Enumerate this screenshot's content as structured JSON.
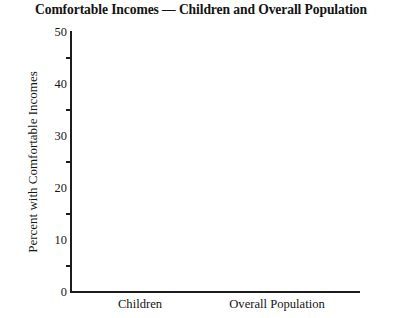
{
  "chart_data": {
    "type": "bar",
    "title": "Comfortable Incomes — Children and Overall Population",
    "subtitle": "",
    "xlabel": "",
    "ylabel": "Percent with Comfortable Incomes",
    "categories": [
      "Children",
      "Overall Population"
    ],
    "values": [
      null,
      null
    ],
    "series": [
      {
        "name": "Percent with Comfortable Incomes",
        "values": [
          null,
          null
        ]
      }
    ],
    "ylim": [
      0,
      50
    ],
    "y_major_ticks": [
      0,
      10,
      20,
      30,
      40,
      50
    ],
    "y_minor_ticks": [
      5,
      15,
      25,
      35,
      45
    ],
    "y_tick_labels": [
      "0",
      "10",
      "20",
      "30",
      "40",
      "50"
    ],
    "grid": false,
    "legend": false,
    "legend_position": "none",
    "colors": {
      "background": "#ffffff",
      "axis": "#1c1c1c",
      "text": "#151515",
      "title": "#141414"
    }
  },
  "axes": {
    "y_title": "Percent with Comfortable Incomes",
    "major_ticks": [
      {
        "value": 50,
        "label": "50"
      },
      {
        "value": 40,
        "label": "40"
      },
      {
        "value": 30,
        "label": "30"
      },
      {
        "value": 20,
        "label": "20"
      },
      {
        "value": 10,
        "label": "10"
      },
      {
        "value": 0,
        "label": "0"
      }
    ],
    "minor_ticks": [
      45,
      35,
      25,
      15,
      5
    ],
    "x_categories": [
      {
        "label": "Children",
        "center_px": 140
      },
      {
        "label": "Overall Population",
        "center_px": 277
      }
    ]
  }
}
